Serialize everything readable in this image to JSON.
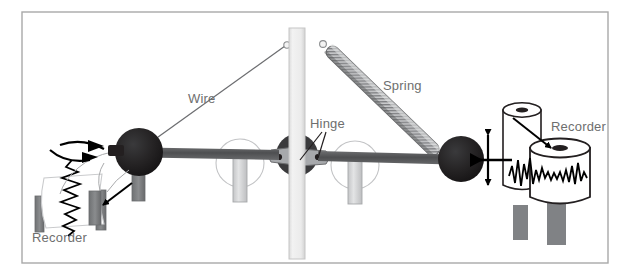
{
  "figure": {
    "frame": {
      "x": 22,
      "y": 12,
      "width": 586,
      "height": 251,
      "border_color": "#a9a9a9",
      "background": "#ffffff"
    },
    "colors": {
      "mass": "#231f20",
      "beam": "#58595b",
      "post": "#ececec",
      "post_edge": "#c6c6c6",
      "roller": "#d6d7d8",
      "hinge_plate": "#a7a9ac",
      "hinge_dark": "#3a3a3c",
      "spring_body": "#b9babc",
      "spring_shade": "#6e6f71",
      "drum_white": "#ffffff",
      "drum_outline": "#231f20",
      "drum_hole": "#231f20",
      "pedestal": "#808285",
      "trace": "#000000",
      "wire": "#6d6e71",
      "label": "#6e6e6e",
      "arrow": "#000000"
    },
    "labels": [
      {
        "id": "wire",
        "text": "Wire",
        "x": 188,
        "y": 103
      },
      {
        "id": "hinge",
        "text": "Hinge",
        "x": 310,
        "y": 128
      },
      {
        "id": "spring",
        "text": "Spring",
        "x": 383,
        "y": 90
      },
      {
        "id": "recorder-right",
        "text": "Recorder",
        "x": 551,
        "y": 131
      },
      {
        "id": "recorder-left",
        "text": "Recorder",
        "x": 32,
        "y": 242
      }
    ],
    "components": {
      "left_mass": {
        "cx": 139,
        "cy": 152,
        "r": 24
      },
      "right_mass": {
        "cx": 461,
        "cy": 159,
        "r": 23
      },
      "beam_left_y": 152,
      "beam_right_y": 157,
      "post": {
        "x": 289,
        "y": 28,
        "width": 16,
        "height": 231
      },
      "spring": {
        "x1": 327,
        "y1": 47,
        "x2": 442,
        "y2": 158
      },
      "wire": {
        "x1": 139,
        "y1": 150,
        "x2": 286,
        "y2": 46
      },
      "rollers": [
        {
          "cx": 240,
          "cy": 163
        },
        {
          "cx": 355,
          "cy": 165
        }
      ]
    },
    "motion_indicators": {
      "left": "rotational-double-arrow",
      "right": "vertical-double-arrow"
    },
    "traces": {
      "left_orientation": "vertical",
      "right_orientation": "horizontal"
    }
  }
}
